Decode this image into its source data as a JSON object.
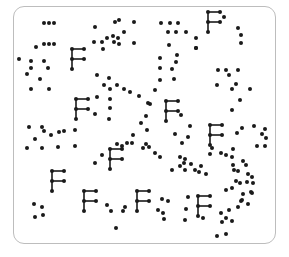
{
  "stimulus": {
    "description": "Visual search display: scattered dots with letter F shapes",
    "target_letter": "F",
    "colors": {
      "ink": "#1a1a1a",
      "frame": "#bdbdbd",
      "background": "#ffffff"
    },
    "f_shapes": [
      {
        "x": 72,
        "y": 49
      },
      {
        "x": 76,
        "y": 99
      },
      {
        "x": 208,
        "y": 12
      },
      {
        "x": 166,
        "y": 101
      },
      {
        "x": 210,
        "y": 125
      },
      {
        "x": 110,
        "y": 149
      },
      {
        "x": 52,
        "y": 171
      },
      {
        "x": 84,
        "y": 191
      },
      {
        "x": 137,
        "y": 191
      },
      {
        "x": 198,
        "y": 196
      }
    ],
    "dots": [
      [
        44,
        23
      ],
      [
        49,
        23
      ],
      [
        54,
        23
      ],
      [
        44,
        44
      ],
      [
        49,
        44
      ],
      [
        54,
        44
      ],
      [
        36,
        47
      ],
      [
        19,
        59
      ],
      [
        31,
        61
      ],
      [
        44,
        61
      ],
      [
        31,
        68
      ],
      [
        48,
        68
      ],
      [
        27,
        74
      ],
      [
        40,
        79
      ],
      [
        31,
        89
      ],
      [
        49,
        89
      ],
      [
        95,
        27
      ],
      [
        115,
        22
      ],
      [
        119,
        20
      ],
      [
        134,
        22
      ],
      [
        113,
        36
      ],
      [
        107,
        38
      ],
      [
        102,
        42
      ],
      [
        94,
        42
      ],
      [
        114,
        42
      ],
      [
        119,
        44
      ],
      [
        134,
        43
      ],
      [
        103,
        49
      ],
      [
        118,
        38
      ],
      [
        124,
        32
      ],
      [
        161,
        23
      ],
      [
        170,
        23
      ],
      [
        178,
        23
      ],
      [
        168,
        32
      ],
      [
        176,
        32
      ],
      [
        186,
        32
      ],
      [
        169,
        45
      ],
      [
        196,
        38
      ],
      [
        196,
        48
      ],
      [
        177,
        55
      ],
      [
        176,
        62
      ],
      [
        160,
        58
      ],
      [
        160,
        68
      ],
      [
        172,
        69
      ],
      [
        160,
        80
      ],
      [
        174,
        79
      ],
      [
        155,
        90
      ],
      [
        150,
        104
      ],
      [
        146,
        116
      ],
      [
        224,
        17
      ],
      [
        241,
        35
      ],
      [
        238,
        28
      ],
      [
        241,
        43
      ],
      [
        196,
        48
      ],
      [
        218,
        70
      ],
      [
        226,
        70
      ],
      [
        229,
        75
      ],
      [
        238,
        70
      ],
      [
        217,
        85
      ],
      [
        232,
        89
      ],
      [
        236,
        84
      ],
      [
        250,
        89
      ],
      [
        240,
        100
      ],
      [
        232,
        110
      ],
      [
        97,
        75
      ],
      [
        109,
        78
      ],
      [
        104,
        85
      ],
      [
        110,
        89
      ],
      [
        117,
        85
      ],
      [
        124,
        89
      ],
      [
        130,
        92
      ],
      [
        110,
        99
      ],
      [
        110,
        108
      ],
      [
        97,
        97
      ],
      [
        95,
        114
      ],
      [
        139,
        96
      ],
      [
        141,
        123
      ],
      [
        109,
        119
      ],
      [
        29,
        127
      ],
      [
        42,
        127
      ],
      [
        44,
        131
      ],
      [
        51,
        135
      ],
      [
        59,
        132
      ],
      [
        64,
        131
      ],
      [
        75,
        130
      ],
      [
        35,
        139
      ],
      [
        27,
        148
      ],
      [
        42,
        148
      ],
      [
        58,
        147
      ],
      [
        75,
        146
      ],
      [
        143,
        148
      ],
      [
        149,
        147
      ],
      [
        146,
        144
      ],
      [
        147,
        130
      ],
      [
        155,
        153
      ],
      [
        181,
        115
      ],
      [
        190,
        126
      ],
      [
        175,
        134
      ],
      [
        188,
        137
      ],
      [
        148,
        103
      ],
      [
        160,
        157
      ],
      [
        180,
        157
      ],
      [
        185,
        159
      ],
      [
        182,
        143
      ],
      [
        212,
        148
      ],
      [
        237,
        133
      ],
      [
        242,
        128
      ],
      [
        254,
        126
      ],
      [
        265,
        129
      ],
      [
        262,
        134
      ],
      [
        266,
        138
      ],
      [
        265,
        146
      ],
      [
        257,
        146
      ],
      [
        102,
        155
      ],
      [
        95,
        163
      ],
      [
        117,
        144
      ],
      [
        122,
        146
      ],
      [
        127,
        143
      ],
      [
        132,
        143
      ],
      [
        133,
        135
      ],
      [
        184,
        163
      ],
      [
        180,
        166
      ],
      [
        191,
        164
      ],
      [
        195,
        170
      ],
      [
        199,
        172
      ],
      [
        201,
        166
      ],
      [
        210,
        154
      ],
      [
        206,
        174
      ],
      [
        172,
        170
      ],
      [
        185,
        170
      ],
      [
        233,
        149
      ],
      [
        233,
        165
      ],
      [
        234,
        170
      ],
      [
        236,
        181
      ],
      [
        240,
        183
      ],
      [
        232,
        188
      ],
      [
        247,
        182
      ],
      [
        226,
        190
      ],
      [
        243,
        194
      ],
      [
        251,
        192
      ],
      [
        221,
        153
      ],
      [
        226,
        155
      ],
      [
        232,
        157
      ],
      [
        243,
        161
      ],
      [
        246,
        165
      ],
      [
        238,
        171
      ],
      [
        248,
        174
      ],
      [
        252,
        177
      ],
      [
        253,
        183
      ],
      [
        241,
        201
      ],
      [
        238,
        207
      ],
      [
        162,
        199
      ],
      [
        168,
        201
      ],
      [
        158,
        210
      ],
      [
        163,
        213
      ],
      [
        188,
        197
      ],
      [
        186,
        209
      ],
      [
        185,
        220
      ],
      [
        164,
        219
      ],
      [
        203,
        218
      ],
      [
        34,
        204
      ],
      [
        42,
        207
      ],
      [
        35,
        217
      ],
      [
        43,
        215
      ],
      [
        107,
        205
      ],
      [
        111,
        211
      ],
      [
        123,
        211
      ],
      [
        125,
        207
      ],
      [
        116,
        228
      ],
      [
        221,
        213
      ],
      [
        229,
        210
      ],
      [
        226,
        218
      ],
      [
        222,
        222
      ],
      [
        232,
        221
      ],
      [
        217,
        236
      ],
      [
        226,
        234
      ],
      [
        252,
        193
      ],
      [
        242,
        200
      ],
      [
        248,
        204
      ]
    ]
  }
}
